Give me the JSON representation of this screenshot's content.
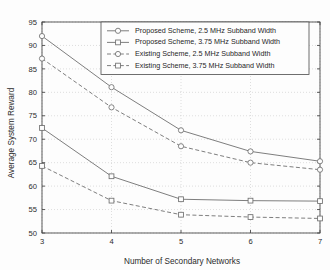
{
  "chart_data": {
    "type": "line",
    "title": "",
    "xlabel": "Number of Secondary Networks",
    "ylabel": "Average System Reward",
    "x": [
      3,
      4,
      5,
      6,
      7
    ],
    "xtick_labels": [
      "3",
      "4",
      "5",
      "6",
      "7"
    ],
    "ytick_labels": [
      "50",
      "55",
      "60",
      "65",
      "70",
      "75",
      "80",
      "85",
      "90",
      "95"
    ],
    "yticks": [
      50,
      55,
      60,
      65,
      70,
      75,
      80,
      85,
      90,
      95
    ],
    "xlim": [
      3,
      7
    ],
    "ylim": [
      50,
      95
    ],
    "grid": true,
    "grid_style": "dotted",
    "legend_position": "top-center",
    "line_color": "#6f6f6f",
    "marker_color": "#6f6f6f",
    "axis_color": "#4a4a4a",
    "grid_color": "#c9c9c9",
    "background_color": "#fdfdfd",
    "series": [
      {
        "name": "Proposed Scheme, 2.5 MHz Subband Width",
        "values": [
          92.0,
          81.1,
          71.9,
          67.4,
          65.3
        ],
        "line": "solid",
        "marker": "circle"
      },
      {
        "name": "Proposed Scheme, 3.75 MHz Subband Width",
        "values": [
          72.4,
          62.1,
          57.2,
          56.9,
          56.8
        ],
        "line": "solid",
        "marker": "square"
      },
      {
        "name": "Existing Scheme, 2.5 MHz Subband Width",
        "values": [
          87.2,
          76.8,
          68.5,
          65.0,
          63.5
        ],
        "line": "dashed",
        "marker": "circle"
      },
      {
        "name": "Existing Scheme, 3.75 MHz Subband Width",
        "values": [
          64.3,
          56.9,
          53.9,
          53.4,
          53.1
        ],
        "line": "dashed",
        "marker": "square"
      }
    ]
  }
}
